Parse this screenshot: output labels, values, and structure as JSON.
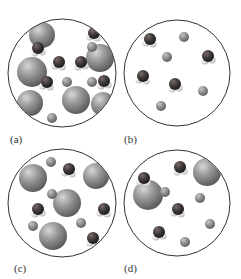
{
  "figure": {
    "panels": [
      {
        "id": "a",
        "label": "(a)",
        "circle": {
          "cx": 62,
          "cy": 73,
          "r": 54
        },
        "large": [
          [
            42,
            35,
            13
          ],
          [
            100,
            58,
            14
          ],
          [
            32,
            72,
            15
          ],
          [
            76,
            100,
            14
          ],
          [
            30,
            103,
            13
          ],
          [
            103,
            104,
            12
          ],
          [
            61,
            62,
            0
          ]
        ],
        "small": [
          [
            92,
            47,
            5
          ],
          [
            67,
            82,
            5
          ],
          [
            92,
            82,
            5
          ],
          [
            52,
            118,
            5
          ]
        ],
        "water": [
          [
            94,
            33
          ],
          [
            38,
            48
          ],
          [
            59,
            62
          ],
          [
            81,
            62
          ],
          [
            47,
            82
          ],
          [
            104,
            81
          ]
        ]
      },
      {
        "id": "b",
        "label": "(b)",
        "circle": {
          "cx": 177,
          "cy": 73,
          "r": 53
        },
        "large": [],
        "small": [
          [
            184,
            37,
            5
          ],
          [
            167,
            57,
            5
          ],
          [
            203,
            91,
            5
          ],
          [
            161,
            106,
            5
          ]
        ],
        "water": [
          [
            150,
            39
          ],
          [
            208,
            56
          ],
          [
            143,
            76
          ],
          [
            175,
            84
          ]
        ]
      },
      {
        "id": "c",
        "label": "(c)",
        "circle": {
          "cx": 62,
          "cy": 203,
          "r": 54
        },
        "large": [
          [
            33,
            178,
            14
          ],
          [
            96,
            176,
            13
          ],
          [
            67,
            203,
            14
          ],
          [
            53,
            236,
            14
          ]
        ],
        "small": [
          [
            51,
            162,
            5
          ],
          [
            52,
            194,
            5
          ],
          [
            33,
            226,
            5
          ],
          [
            81,
            223,
            5
          ]
        ],
        "water": [
          [
            69,
            169
          ],
          [
            38,
            209
          ],
          [
            104,
            209
          ],
          [
            93,
            238
          ]
        ]
      },
      {
        "id": "d",
        "label": "(d)",
        "circle": {
          "cx": 177,
          "cy": 203,
          "r": 53
        },
        "large": [
          [
            207,
            172,
            14
          ],
          [
            148,
            195,
            15
          ]
        ],
        "small": [
          [
            165,
            192,
            5
          ],
          [
            200,
            198,
            5
          ],
          [
            210,
            224,
            5
          ],
          [
            185,
            242,
            5
          ]
        ],
        "water": [
          [
            144,
            178
          ],
          [
            180,
            167
          ],
          [
            178,
            209
          ],
          [
            159,
            232
          ]
        ]
      }
    ],
    "legend_colors": {
      "large_sphere": "#8a8a8a",
      "small_sphere": "#8a8a8a",
      "oxygen": "#4a4a4a",
      "hydrogen": "#e8e8e8",
      "outline": "#333333"
    }
  },
  "labels": {
    "a": "(a)",
    "b": "(b)",
    "c": "(c)",
    "d": "(d)"
  }
}
